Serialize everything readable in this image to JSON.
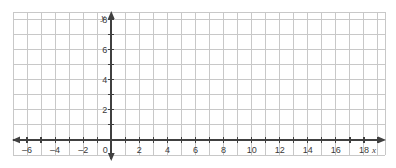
{
  "chart_data": {
    "type": "scatter",
    "title": "",
    "xlabel": "x",
    "ylabel": "y",
    "grid": true,
    "legend": false,
    "series": [],
    "x": [],
    "values": [],
    "xlim": [
      -7.0,
      19.5
    ],
    "ylim": [
      -1.0,
      8.5
    ],
    "x_major_step": 2,
    "y_major_step": 2,
    "x_tick_step": 1,
    "y_tick_step": 1,
    "grid_step": 1,
    "x_tick_labels": [
      "–6",
      "–4",
      "–2",
      "0",
      "2",
      "4",
      "6",
      "8",
      "10",
      "12",
      "14",
      "16",
      "18"
    ],
    "x_tick_values": [
      -6,
      -4,
      -2,
      0,
      2,
      4,
      6,
      8,
      10,
      12,
      14,
      16,
      18
    ],
    "y_tick_labels": [
      "2",
      "4",
      "6",
      "8"
    ],
    "y_tick_values": [
      2,
      4,
      6,
      8
    ],
    "origin_label": "0",
    "arrows": [
      "left",
      "right",
      "up",
      "down"
    ],
    "colors": {
      "grid": "#c8c8c8",
      "axis": "#404040",
      "text": "#3a3a3a",
      "background": "#ffffff"
    }
  }
}
